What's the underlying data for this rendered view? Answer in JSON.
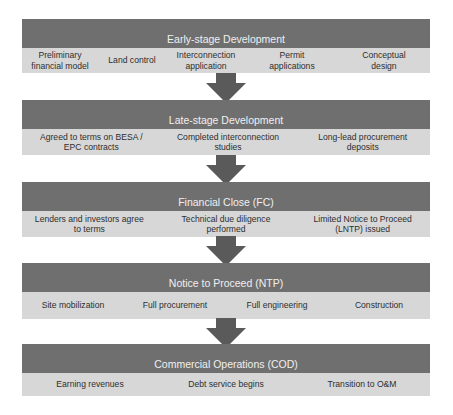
{
  "stages": [
    {
      "title": "Early-stage Development",
      "items": [
        "Preliminary financial model",
        "Land control",
        "Interconnection application",
        "Permit applications",
        "Conceptual design"
      ]
    },
    {
      "title": "Late-stage Development",
      "items": [
        "Agreed to terms on BESA / EPC contracts",
        "Completed interconnection studies",
        "Long-lead procurement deposits"
      ]
    },
    {
      "title": "Financial Close (FC)",
      "items": [
        "Lenders and investors agree to terms",
        "Technical due diligence performed",
        "Limited Notice to Proceed (LNTP) issued"
      ]
    },
    {
      "title": "Notice to Proceed (NTP)",
      "items": [
        "Site mobilization",
        "Full procurement",
        "Full engineering",
        "Construction"
      ]
    },
    {
      "title": "Commercial Operations (COD)",
      "items": [
        "Earning revenues",
        "Debt service begins",
        "Transition to O&M"
      ]
    }
  ],
  "colors": {
    "header_bg": "#6f6f6f",
    "items_bg": "#d7d7d7",
    "arrow": "#5a5a5a"
  }
}
